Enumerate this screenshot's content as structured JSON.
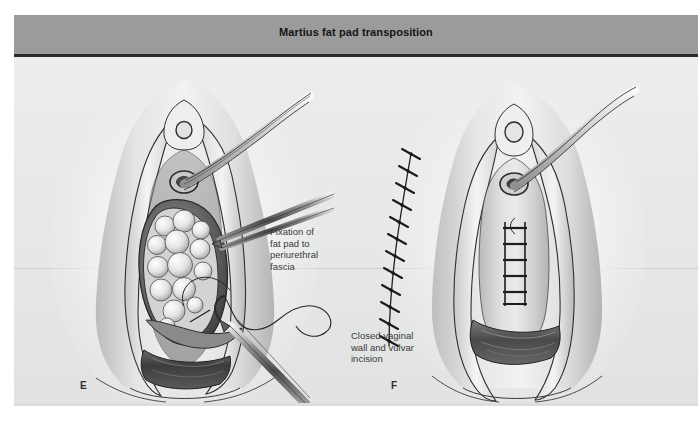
{
  "figure": {
    "title": "Martius fat pad transposition",
    "title_bar_color": "#9b9b9b",
    "title_text_color": "#151515",
    "canvas_color": "#e9eaea",
    "ink_color": "#2b2b2b"
  },
  "panels": [
    {
      "letter": "E",
      "name": "fat-pad-fixation-panel",
      "callout": "Fixation of\nfat pad to\nperiurethral\nfascia",
      "elements": {
        "fat_pad": "lobular-fat-pad-graft",
        "catheter": "urethral-catheter",
        "forceps": "tissue-forceps",
        "needle_driver": "needle-driver-with-curved-needle",
        "suture_thread": "suture-thread-loop",
        "urethral_meatus": "urethral-meatus",
        "clitoris": "clitoris",
        "vaginal_cavity": "open-vaginal-cavity",
        "labia": "retracted-labia-majora",
        "vaginal_introitus": "vaginal-introitus"
      }
    },
    {
      "letter": "F",
      "name": "closed-incision-panel",
      "callout": "Closed vaginal\nwall and vulvar\nincision",
      "elements": {
        "labial_suture_line": "interrupted-labial-suture-line",
        "labial_stitch_count": 12,
        "vaginal_suture_ladder": "midline-vaginal-suture-line",
        "vaginal_rung_count": 5,
        "catheter": "urethral-catheter",
        "urethral_meatus": "urethral-meatus",
        "clitoris": "clitoris",
        "vaginal_introitus": "vaginal-introitus"
      }
    }
  ]
}
